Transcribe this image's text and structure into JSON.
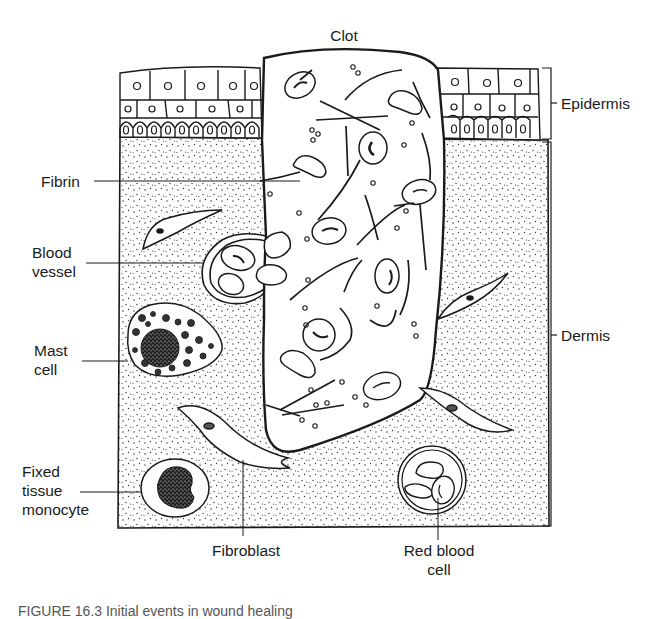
{
  "figure": {
    "title_label": "Clot",
    "caption_partial": "FIGURE 16.3 Initial events in wound healing",
    "colors": {
      "ink": "#1a1a1a",
      "background": "#ffffff",
      "dots": "#333333"
    }
  },
  "labels": {
    "clot": "Clot",
    "epidermis": "Epidermis",
    "dermis": "Dermis",
    "fibrin": "Fibrin",
    "blood_vessel_1": "Blood",
    "blood_vessel_2": "vessel",
    "mast_cell_1": "Mast",
    "mast_cell_2": "cell",
    "fixed_1": "Fixed",
    "fixed_2": "tissue",
    "fixed_3": "monocyte",
    "fibroblast": "Fibroblast",
    "rbc_1": "Red blood",
    "rbc_2": "cell"
  }
}
